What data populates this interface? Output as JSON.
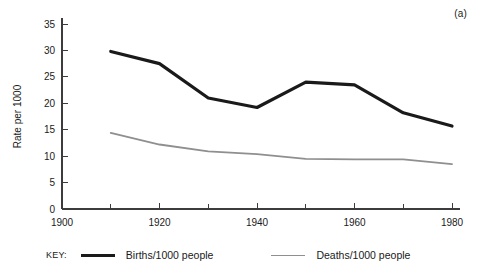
{
  "figure": {
    "panel_label": "(a)",
    "background": "#ffffff"
  },
  "legend": {
    "key_label": "KEY:",
    "entries": [
      {
        "label": "Births/1000 people",
        "color": "#1a1a1a",
        "width": 3.2
      },
      {
        "label": "Deaths/1000 people",
        "color": "#8f8f8f",
        "width": 1.8
      }
    ]
  },
  "chart_data": {
    "type": "line",
    "title": "",
    "subtitle": "",
    "xlabel": "",
    "ylabel": "Rate per 1000",
    "xlim": [
      1900,
      1980
    ],
    "ylim": [
      0,
      35
    ],
    "grid": false,
    "legend_position": "bottom",
    "annotations": [
      "(a)"
    ],
    "x_ticks_major": [
      1900,
      1920,
      1940,
      1960,
      1980
    ],
    "x_ticks_minor": [
      1910,
      1930,
      1950,
      1970
    ],
    "x_tick_labels": [
      "1900",
      "1920",
      "1940",
      "1960",
      "1980"
    ],
    "y_ticks": [
      0,
      5,
      10,
      15,
      20,
      25,
      30,
      35
    ],
    "y_tick_labels": [
      "0",
      "5",
      "10",
      "15",
      "20",
      "25",
      "30",
      "35"
    ],
    "x": [
      1910,
      1920,
      1930,
      1940,
      1950,
      1960,
      1970,
      1980
    ],
    "series": [
      {
        "name": "Births/1000 people",
        "color": "#1a1a1a",
        "line_width": 3.2,
        "values": [
          29.8,
          27.5,
          21.0,
          19.2,
          24.0,
          23.5,
          18.2,
          15.7
        ]
      },
      {
        "name": "Deaths/1000 people",
        "color": "#8f8f8f",
        "line_width": 1.8,
        "values": [
          14.4,
          12.2,
          10.9,
          10.4,
          9.5,
          9.4,
          9.4,
          8.5
        ]
      }
    ]
  }
}
